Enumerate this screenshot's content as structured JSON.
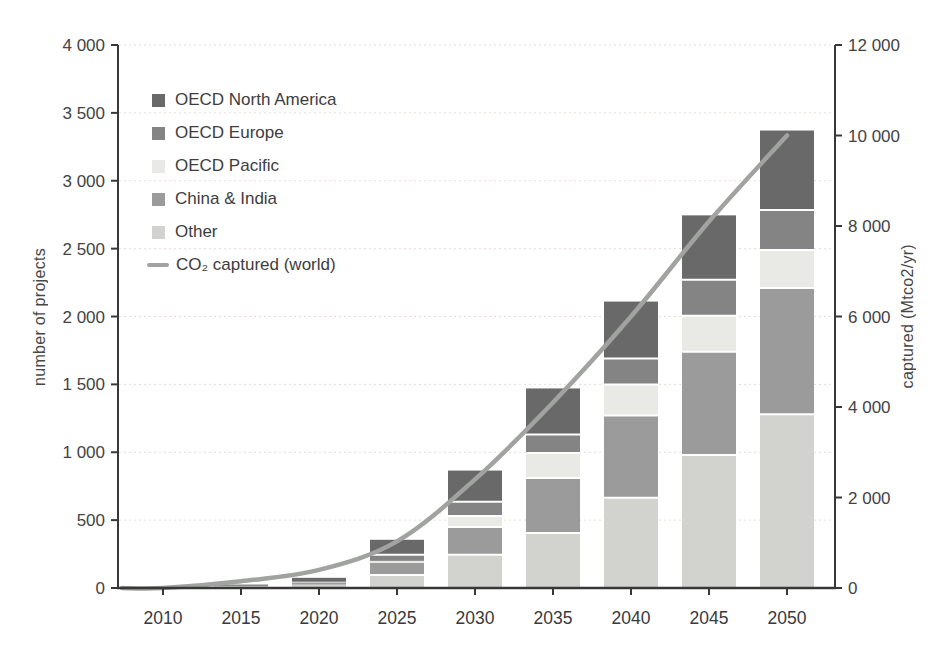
{
  "chart_data": {
    "type": "bar",
    "subtype": "stacked-bars-with-line-overlay",
    "title": "",
    "categories": [
      "2010",
      "2015",
      "2020",
      "2025",
      "2030",
      "2035",
      "2040",
      "2045",
      "2050"
    ],
    "stack_order_bottom_to_top": [
      "Other",
      "China & India",
      "OECD Pacific",
      "OECD Europe",
      "OECD North America"
    ],
    "series": [
      {
        "name": "OECD North America",
        "color": "#696969",
        "values": [
          1,
          8,
          25,
          110,
          230,
          340,
          420,
          475,
          585
        ]
      },
      {
        "name": "OECD Europe",
        "color": "#848484",
        "values": [
          1,
          3,
          8,
          45,
          105,
          135,
          190,
          265,
          295
        ]
      },
      {
        "name": "OECD Pacific",
        "color": "#e9e9e6",
        "values": [
          0,
          1,
          4,
          15,
          80,
          185,
          230,
          265,
          280
        ]
      },
      {
        "name": "China & India",
        "color": "#9b9b9b",
        "values": [
          1,
          4,
          13,
          90,
          205,
          405,
          605,
          760,
          930
        ]
      },
      {
        "name": "Other",
        "color": "#d2d2cf",
        "values": [
          2,
          9,
          25,
          95,
          245,
          405,
          665,
          980,
          1280
        ]
      }
    ],
    "line_series": {
      "name": "CO₂ captured (world)",
      "color": "#a0a39f",
      "axis": "right",
      "values": [
        0,
        150,
        400,
        1030,
        2400,
        4100,
        6000,
        8100,
        10000
      ]
    },
    "left_axis": {
      "label": "number of projects",
      "min": 0,
      "max": 4000,
      "tick_step": 500
    },
    "right_axis": {
      "label": "captured (Mtco2/yr)",
      "min": 0,
      "max": 12000,
      "tick_step": 2000
    },
    "grid": "horizontal-dotted",
    "legend_position": "upper-left-inside",
    "colors": {
      "axis": "#383838",
      "tick_text": "#434343",
      "gridline": "#e8dcd7",
      "segment_separator": "#ffffff"
    }
  }
}
